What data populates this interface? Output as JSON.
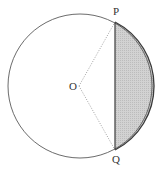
{
  "diagram": {
    "type": "circle-segment",
    "circle": {
      "cx": 80,
      "cy": 86,
      "r": 72,
      "stroke": "#555555"
    },
    "center": {
      "label": "O",
      "x": 79,
      "y": 86,
      "label_x": 69,
      "label_y": 90
    },
    "points": [
      {
        "label": "P",
        "x": 115,
        "y": 22,
        "label_x": 113,
        "label_y": 15
      },
      {
        "label": "Q",
        "x": 115,
        "y": 150,
        "label_x": 112,
        "label_y": 163
      }
    ],
    "radii": {
      "style": "dotted",
      "color": "#888888"
    },
    "chord": {
      "from": "P",
      "to": "Q",
      "color": "#444444"
    },
    "shaded_segment": {
      "between": "chord PQ and minor arc PQ",
      "fill": "#c8c8c8"
    }
  }
}
